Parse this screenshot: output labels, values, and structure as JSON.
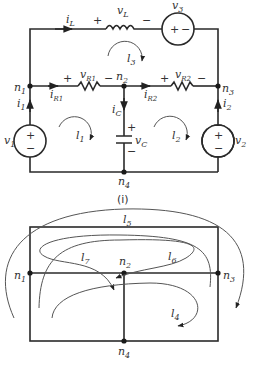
{
  "figure": {
    "caption": "(i)",
    "nodes": [
      {
        "id": "n1",
        "label": "n",
        "sub": "1"
      },
      {
        "id": "n2",
        "label": "n",
        "sub": "2"
      },
      {
        "id": "n3",
        "label": "n",
        "sub": "3"
      },
      {
        "id": "n4",
        "label": "n",
        "sub": "4"
      }
    ],
    "circuit": {
      "currents": {
        "iL": {
          "label": "i",
          "sub": "L"
        },
        "i1": {
          "label": "i",
          "sub": "1"
        },
        "i2": {
          "label": "i",
          "sub": "2"
        },
        "iR1": {
          "label": "i",
          "sub": "R1"
        },
        "iR2": {
          "label": "i",
          "sub": "R2"
        },
        "iC": {
          "label": "i",
          "sub": "C"
        }
      },
      "voltages": {
        "vL": {
          "label": "v",
          "sub": "L"
        },
        "v3": {
          "label": "v",
          "sub": "3"
        },
        "vR1": {
          "label": "v",
          "sub": "R1"
        },
        "vR2": {
          "label": "v",
          "sub": "R2"
        },
        "vC": {
          "label": "v",
          "sub": "C"
        },
        "v1": {
          "label": "v",
          "sub": "1"
        },
        "v2": {
          "label": "v",
          "sub": "2"
        }
      },
      "plus": "+",
      "minus": "−",
      "loops": [
        {
          "id": "l1",
          "label": "l",
          "sub": "1"
        },
        {
          "id": "l2",
          "label": "l",
          "sub": "2"
        },
        {
          "id": "l3",
          "label": "l",
          "sub": "3"
        }
      ]
    },
    "graph": {
      "loops": [
        {
          "id": "l4",
          "label": "l",
          "sub": "4"
        },
        {
          "id": "l5",
          "label": "l",
          "sub": "5"
        },
        {
          "id": "l6",
          "label": "l",
          "sub": "6"
        },
        {
          "id": "l7",
          "label": "l",
          "sub": "7"
        }
      ]
    }
  }
}
